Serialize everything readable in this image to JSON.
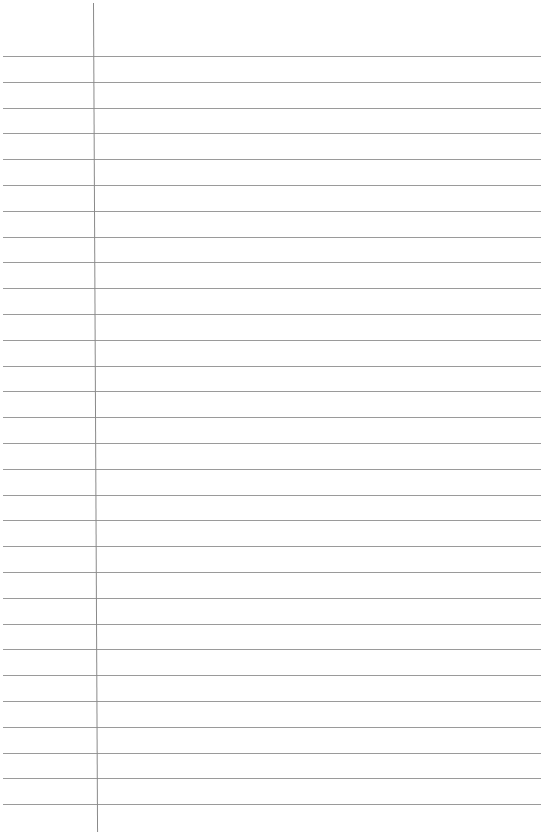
{
  "page": {
    "type": "ruled-paper",
    "background_color": "#ffffff",
    "rule_color": "#9a9a9a",
    "margin_line_color": "#8a8a8a",
    "rules": {
      "count": 30,
      "first_y": 56,
      "spacing": 25.8
    },
    "margin_line_x": 93
  }
}
